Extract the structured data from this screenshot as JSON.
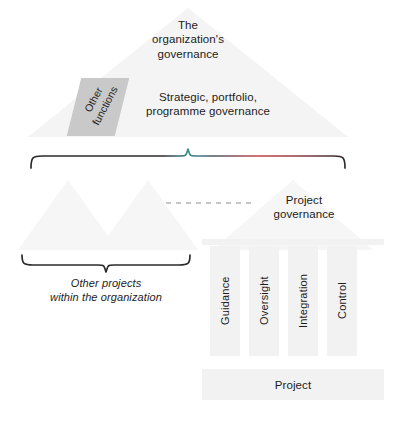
{
  "diagram": {
    "background_color": "#ffffff",
    "triangle_fill": "#f4f4f4",
    "pillar_fill": "#f2f2f2",
    "other_functions_fill": "#c9c9c9",
    "brace_color": "#2b2b2b",
    "dashed_line_color": "#8c8c8c",
    "text_color": "#1c1c1c"
  },
  "apex": {
    "label": "The\norganization's\ngovernance"
  },
  "band": {
    "label": "Strategic, portfolio,\nprogramme governance",
    "other_functions_label": "Other\nfunctions"
  },
  "project_governance": {
    "label": "Project\ngovernance"
  },
  "other_projects": {
    "label": "Other projects\nwithin the organization"
  },
  "pillars": [
    {
      "label": "Guidance"
    },
    {
      "label": "Oversight"
    },
    {
      "label": "Integration"
    },
    {
      "label": "Control"
    }
  ],
  "base": {
    "label": "Project"
  }
}
